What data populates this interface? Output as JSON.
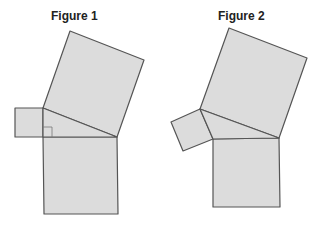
{
  "figures": [
    {
      "title": "Figure 1",
      "title_pos": [
        51,
        9
      ],
      "shapes": {
        "large_square": "70,31 144,60 117,137 43,108",
        "small_square": "15,108 43,108 43,137 15,137",
        "triangle": "43,108 117,137 43,137",
        "bottom_square": "43,137 117,137 118,214 44,214",
        "right_angle_marker": "43,127 52,127 52,137"
      }
    },
    {
      "title": "Figure 2",
      "title_pos": [
        218,
        9
      ],
      "shapes": {
        "large_square": "229,28 307,58 279,138 200,109",
        "small_square": "171,122 200,109 213,139 183,151",
        "triangle": "200,109 279,138 213,139",
        "bottom_square": "213,139 279,138 280,207 213,207"
      }
    }
  ],
  "colors": {
    "fill": "#dcdcdc",
    "stroke": "#555555"
  }
}
